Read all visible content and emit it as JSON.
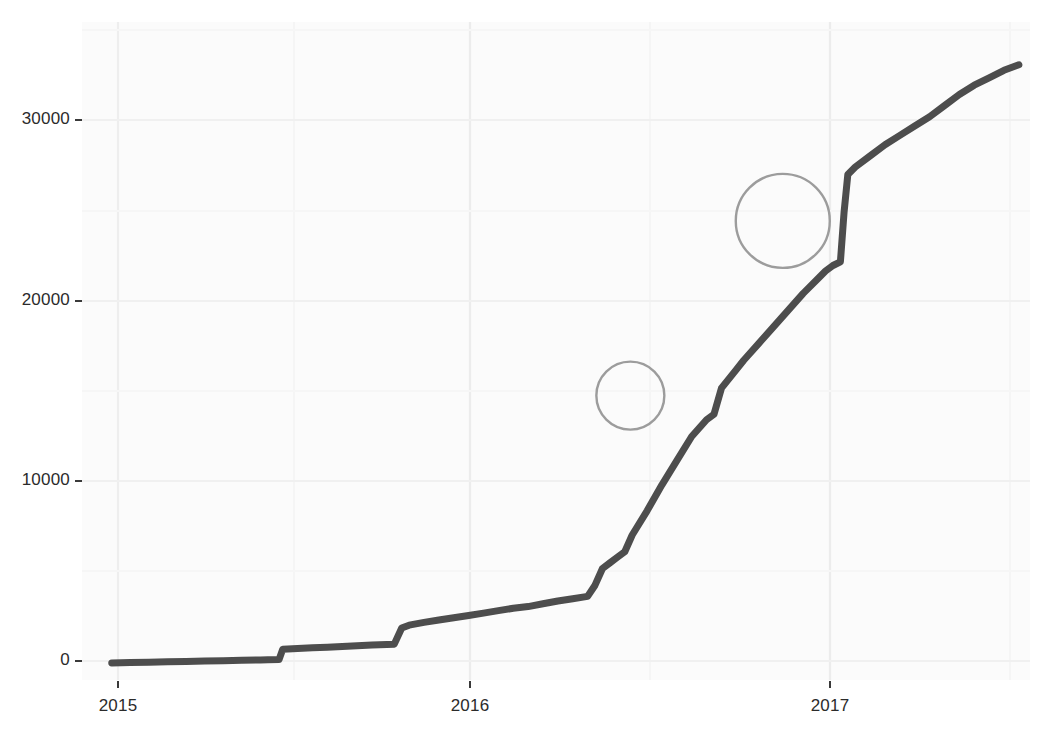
{
  "chart_data": {
    "type": "line",
    "title": "",
    "subtitle": "",
    "xlabel": "",
    "ylabel": "",
    "xlim": [
      2014.92,
      2017.47
    ],
    "ylim": [
      -900,
      34500
    ],
    "grid": true,
    "legend_position": "none",
    "x_tick_labels": [
      "2015",
      "2016",
      "2017"
    ],
    "x_tick_values": [
      2015,
      2016,
      2017
    ],
    "y_tick_labels": [
      "0",
      "10000",
      "20000",
      "30000"
    ],
    "y_tick_values": [
      0,
      10000,
      20000,
      30000
    ],
    "series": [
      {
        "name": "cumulative count",
        "color": "#4d4d4d",
        "x": [
          2015.0,
          2015.05,
          2015.1,
          2015.15,
          2015.2,
          2015.25,
          2015.3,
          2015.35,
          2015.4,
          2015.42,
          2015.45,
          2015.46,
          2015.5,
          2015.54,
          2015.58,
          2015.62,
          2015.66,
          2015.7,
          2015.74,
          2015.76,
          2015.78,
          2015.8,
          2015.84,
          2015.88,
          2015.92,
          2015.96,
          2016.0,
          2016.04,
          2016.08,
          2016.12,
          2016.16,
          2016.2,
          2016.24,
          2016.28,
          2016.3,
          2016.32,
          2016.34,
          2016.36,
          2016.38,
          2016.4,
          2016.44,
          2016.48,
          2016.52,
          2016.56,
          2016.6,
          2016.62,
          2016.64,
          2016.66,
          2016.68,
          2016.7,
          2016.74,
          2016.78,
          2016.82,
          2016.86,
          2016.9,
          2016.92,
          2016.94,
          2016.96,
          2016.97,
          2016.98,
          2017.0,
          2017.04,
          2017.08,
          2017.12,
          2017.16,
          2017.2,
          2017.24,
          2017.28,
          2017.32,
          2017.36,
          2017.4,
          2017.44
        ],
        "y": [
          20,
          40,
          60,
          80,
          100,
          120,
          140,
          160,
          180,
          190,
          200,
          760,
          800,
          830,
          860,
          900,
          940,
          980,
          1010,
          1030,
          1900,
          2050,
          2200,
          2330,
          2450,
          2570,
          2700,
          2830,
          2960,
          3050,
          3200,
          3350,
          3470,
          3600,
          4200,
          5100,
          5400,
          5700,
          6000,
          6900,
          8200,
          9600,
          10900,
          12200,
          13100,
          13400,
          14800,
          15300,
          15800,
          16300,
          17200,
          18100,
          19000,
          19900,
          20700,
          21100,
          21400,
          21600,
          24300,
          26300,
          26700,
          27300,
          27900,
          28400,
          28900,
          29400,
          30000,
          30600,
          31100,
          31500,
          31900,
          32200
        ]
      }
    ],
    "annotations": [
      {
        "shape": "circle",
        "name": "jump-highlight-1",
        "cx": 2016.395,
        "cy": 14400,
        "r_px": 34,
        "color": "#9c9c9c",
        "note": "circled step jump"
      },
      {
        "shape": "circle",
        "name": "jump-highlight-2",
        "cx": 2016.805,
        "cy": 23800,
        "r_px": 47,
        "color": "#9c9c9c",
        "note": "circled step jump"
      }
    ],
    "colors": {
      "line": "#4d4d4d",
      "annotation": "#9c9c9c",
      "panel_background": "#fbfbfb",
      "grid_major": "#f0f0f0",
      "grid_minor": "#f6f6f6",
      "tick_text": "#2b2b2b",
      "page_background": "#ffffff"
    }
  },
  "axes": {
    "y_ticks": [
      {
        "label": "30000",
        "top": 120
      },
      {
        "label": "20000",
        "top": 301
      },
      {
        "label": "10000",
        "top": 481
      },
      {
        "label": "0",
        "top": 661
      }
    ],
    "x_ticks": [
      {
        "label": "2015",
        "left": 118
      },
      {
        "label": "2016",
        "left": 470
      },
      {
        "label": "2017",
        "left": 830
      }
    ]
  }
}
